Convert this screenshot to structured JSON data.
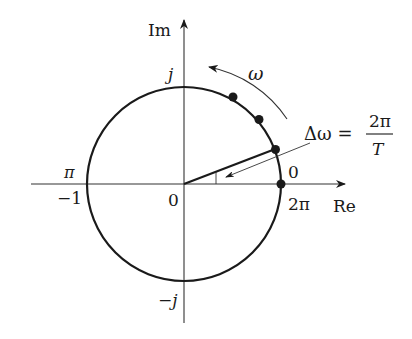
{
  "diagram": {
    "type": "unit-circle-complex-plane",
    "colors": {
      "stroke": "#1a1a1a",
      "axis": "#333333",
      "background": "#ffffff"
    },
    "axes": {
      "real_label": "Re",
      "imag_label": "Im"
    },
    "labels": {
      "origin": "0",
      "imag_pos": "j",
      "imag_neg": "−j",
      "real_neg_one": "−1",
      "pi": "π",
      "zero_angle": "0",
      "two_pi": "2π",
      "omega": "ω"
    },
    "formula": {
      "lhs": "Δω =",
      "numerator": "2π",
      "denominator": "T"
    },
    "points": [
      {
        "name": "sample-0",
        "angle_deg": 0
      },
      {
        "name": "sample-1",
        "angle_deg": 21
      },
      {
        "name": "sample-2",
        "angle_deg": 45
      },
      {
        "name": "sample-3",
        "angle_deg": 62
      }
    ],
    "annotations": {
      "rotation_direction": "counter-clockwise",
      "angle_step": "Δω"
    }
  }
}
